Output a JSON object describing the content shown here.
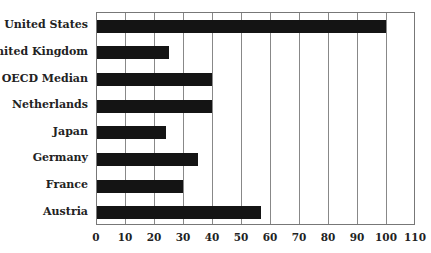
{
  "chart_data": {
    "type": "bar",
    "orientation": "horizontal",
    "title": "",
    "xlabel": "",
    "ylabel": "",
    "categories": [
      "United States",
      "United Kingdom",
      "OECD Median",
      "Netherlands",
      "Japan",
      "Germany",
      "France",
      "Austria"
    ],
    "values": [
      100,
      25,
      40,
      40,
      24,
      35,
      30,
      57
    ],
    "xlim": [
      0,
      110
    ],
    "xticks": [
      0,
      10,
      20,
      30,
      40,
      50,
      60,
      70,
      80,
      90,
      100,
      110
    ],
    "grid": "vertical",
    "legend": null,
    "bar_color": "#141414"
  }
}
